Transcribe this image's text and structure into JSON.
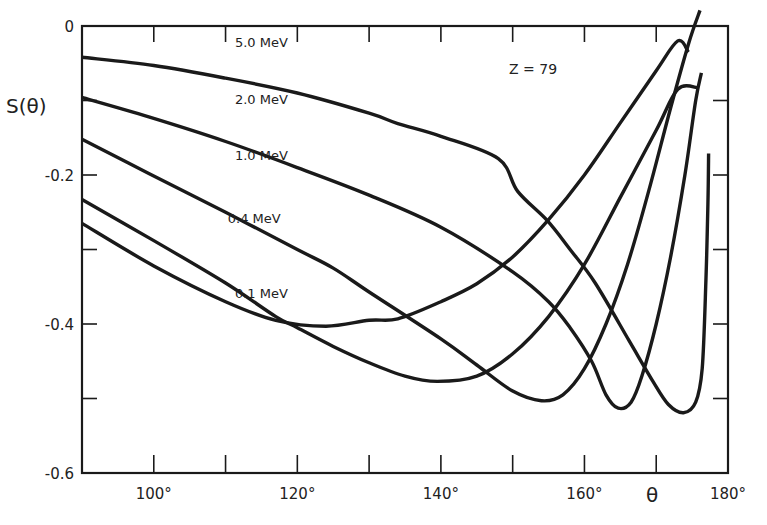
{
  "chart_data": {
    "type": "line",
    "title": "",
    "annotation": "Z = 79",
    "xlabel": "θ",
    "ylabel": "S(θ)",
    "xlim": [
      90,
      180
    ],
    "ylim": [
      -0.6,
      0
    ],
    "grid": false,
    "legend": "inline labels",
    "x_ticks": [
      100,
      110,
      120,
      130,
      140,
      150,
      160,
      170,
      180
    ],
    "x_tick_labels": [
      {
        "value": 100,
        "label": "100°"
      },
      {
        "value": 120,
        "label": "120°"
      },
      {
        "value": 140,
        "label": "140°"
      },
      {
        "value": 160,
        "label": "160°"
      },
      {
        "value": 180,
        "label": "180°"
      }
    ],
    "y_ticks": [
      0,
      -0.1,
      -0.2,
      -0.3,
      -0.4,
      -0.5,
      -0.6
    ],
    "y_tick_labels": [
      {
        "value": 0,
        "label": "0"
      },
      {
        "value": -0.2,
        "label": "-0.2"
      },
      {
        "value": -0.4,
        "label": "-0.4"
      },
      {
        "value": -0.6,
        "label": "-0.6"
      }
    ],
    "series": [
      {
        "name": "5.0 MeV",
        "label_pos": [
          115,
          -0.028
        ],
        "points": [
          [
            90,
            -0.042
          ],
          [
            100,
            -0.053
          ],
          [
            110,
            -0.07
          ],
          [
            120,
            -0.09
          ],
          [
            130,
            -0.117
          ],
          [
            134,
            -0.131
          ],
          [
            140,
            -0.148
          ],
          [
            148,
            -0.178
          ],
          [
            150.7,
            -0.222
          ],
          [
            154.8,
            -0.261
          ],
          [
            158,
            -0.3
          ],
          [
            161.5,
            -0.345
          ],
          [
            166.2,
            -0.422
          ],
          [
            169.6,
            -0.478
          ],
          [
            171.7,
            -0.508
          ],
          [
            173.8,
            -0.519
          ],
          [
            175.5,
            -0.505
          ],
          [
            176.4,
            -0.46
          ],
          [
            176.9,
            -0.35
          ],
          [
            177.2,
            -0.24
          ],
          [
            177.3,
            -0.171
          ]
        ]
      },
      {
        "name": "2.0 MeV",
        "label_pos": [
          115,
          -0.105
        ],
        "points": [
          [
            90,
            -0.096
          ],
          [
            99.3,
            -0.122
          ],
          [
            110,
            -0.155
          ],
          [
            120,
            -0.19
          ],
          [
            130,
            -0.227
          ],
          [
            140,
            -0.27
          ],
          [
            150,
            -0.33
          ],
          [
            155,
            -0.37
          ],
          [
            158,
            -0.405
          ],
          [
            161,
            -0.45
          ],
          [
            163,
            -0.495
          ],
          [
            164.7,
            -0.513
          ],
          [
            166.5,
            -0.505
          ],
          [
            168,
            -0.47
          ],
          [
            170,
            -0.4
          ],
          [
            172,
            -0.31
          ],
          [
            174,
            -0.2
          ],
          [
            175.5,
            -0.1
          ],
          [
            176.3,
            -0.063
          ]
        ]
      },
      {
        "name": "1.0 MeV",
        "label_pos": [
          115,
          -0.18
        ],
        "points": [
          [
            90,
            -0.152
          ],
          [
            99.3,
            -0.198
          ],
          [
            110,
            -0.25
          ],
          [
            120,
            -0.3
          ],
          [
            125,
            -0.325
          ],
          [
            130,
            -0.357
          ],
          [
            140,
            -0.42
          ],
          [
            145,
            -0.455
          ],
          [
            150,
            -0.49
          ],
          [
            154,
            -0.503
          ],
          [
            157,
            -0.495
          ],
          [
            160,
            -0.46
          ],
          [
            163,
            -0.4
          ],
          [
            166,
            -0.32
          ],
          [
            169,
            -0.22
          ],
          [
            172,
            -0.11
          ],
          [
            174.5,
            -0.024
          ],
          [
            176.1,
            0.021
          ]
        ]
      },
      {
        "name": "0.4 MeV",
        "label_pos": [
          114,
          -0.265
        ],
        "points": [
          [
            90,
            -0.233
          ],
          [
            100,
            -0.288
          ],
          [
            110,
            -0.345
          ],
          [
            117,
            -0.39
          ],
          [
            120,
            -0.405
          ],
          [
            125,
            -0.43
          ],
          [
            130,
            -0.452
          ],
          [
            135,
            -0.47
          ],
          [
            139.5,
            -0.477
          ],
          [
            145,
            -0.47
          ],
          [
            150,
            -0.44
          ],
          [
            155,
            -0.39
          ],
          [
            160,
            -0.32
          ],
          [
            165,
            -0.23
          ],
          [
            170,
            -0.14
          ],
          [
            173,
            -0.085
          ],
          [
            175.9,
            -0.083
          ]
        ]
      },
      {
        "name": "0.1 MeV",
        "label_pos": [
          115,
          -0.365
        ],
        "points": [
          [
            90,
            -0.265
          ],
          [
            100,
            -0.322
          ],
          [
            110,
            -0.37
          ],
          [
            117,
            -0.395
          ],
          [
            124,
            -0.403
          ],
          [
            130,
            -0.395
          ],
          [
            134,
            -0.393
          ],
          [
            140,
            -0.37
          ],
          [
            145,
            -0.346
          ],
          [
            150,
            -0.31
          ],
          [
            155,
            -0.26
          ],
          [
            160,
            -0.2
          ],
          [
            165,
            -0.13
          ],
          [
            170,
            -0.06
          ],
          [
            173,
            -0.02
          ],
          [
            174.5,
            -0.035
          ]
        ]
      }
    ]
  }
}
